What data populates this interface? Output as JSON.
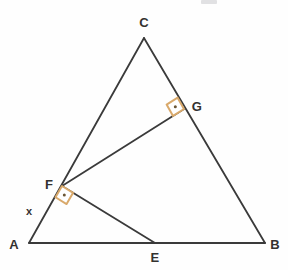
{
  "figure": {
    "canvas": {
      "width": 288,
      "height": 270
    },
    "background_color": "#fefefe",
    "line_color": "#3a3a3a",
    "line_width": 1.8,
    "right_angle_mark_color": "#d9a96b",
    "right_angle_dot_color": "#6b5636",
    "label_color": "#33312f"
  },
  "points": {
    "A": {
      "label": "A",
      "x": 29,
      "y": 243,
      "label_x": 14,
      "label_y": 244
    },
    "B": {
      "label": "B",
      "x": 265,
      "y": 243,
      "label_x": 275,
      "label_y": 244
    },
    "C": {
      "label": "C",
      "x": 144,
      "y": 38,
      "label_x": 144,
      "label_y": 22
    },
    "E": {
      "label": "E",
      "x": 155,
      "y": 243,
      "label_x": 155,
      "label_y": 257
    },
    "F": {
      "label": "F",
      "x": 62,
      "y": 186,
      "label_x": 49,
      "label_y": 184
    },
    "G": {
      "label": "G",
      "x": 184,
      "y": 109,
      "label_x": 197,
      "label_y": 106
    }
  },
  "angle_variable": {
    "label": "x",
    "x": 29,
    "y": 211
  },
  "segments": [
    {
      "name": "side-AB",
      "from": "A",
      "to": "B"
    },
    {
      "name": "side-AC",
      "from": "A",
      "to": "C"
    },
    {
      "name": "side-CB",
      "from": "C",
      "to": "B"
    },
    {
      "name": "cevian-FG",
      "from": "F",
      "to": "G"
    },
    {
      "name": "cevian-FE",
      "from": "F",
      "to": "E"
    }
  ],
  "right_angles": [
    {
      "name": "right-angle-at-F",
      "vertex": "F",
      "arm1": "A",
      "arm2": "E",
      "size": 13
    },
    {
      "name": "right-angle-at-G",
      "vertex": "G",
      "arm1": "F",
      "arm2": "C",
      "size": 13
    }
  ]
}
